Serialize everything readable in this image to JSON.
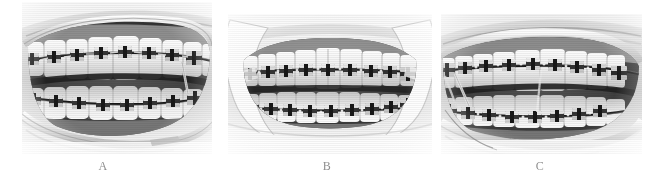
{
  "figure": {
    "background_color": "#ffffff",
    "width": 659,
    "height": 181,
    "modality": "intraoral clinical photograph",
    "color_mode": "grayscale",
    "panel_count": 3
  },
  "panels": [
    {
      "id": "panel-a",
      "caption": "A",
      "view": "left lateral intraoral view",
      "description": "Left buccal view of upper and lower dental arches with fixed orthodontic appliances, brackets and archwires, lip retractor visible",
      "frame": {
        "x": 22,
        "y": 2,
        "width": 190,
        "height": 152
      },
      "caption_pos": {
        "x": 103,
        "y": 160
      }
    },
    {
      "id": "panel-b",
      "caption": "B",
      "view": "frontal intraoral view",
      "description": "Frontal view of upper and lower dental arches in occlusion with fixed orthodontic appliances, brackets and archwires, cheek retractors visible",
      "frame": {
        "x": 228,
        "y": 14,
        "width": 204,
        "height": 140
      },
      "caption_pos": {
        "x": 327,
        "y": 160
      }
    },
    {
      "id": "panel-c",
      "caption": "C",
      "view": "right lateral intraoral view",
      "description": "Right buccal view of upper and lower dental arches with fixed orthodontic appliances, brackets and archwires, lip retractor visible",
      "frame": {
        "x": 441,
        "y": 14,
        "width": 201,
        "height": 140
      },
      "caption_pos": {
        "x": 540,
        "y": 160
      }
    }
  ],
  "caption_style": {
    "color": "#8e8e8e",
    "font_size_px": 12
  }
}
